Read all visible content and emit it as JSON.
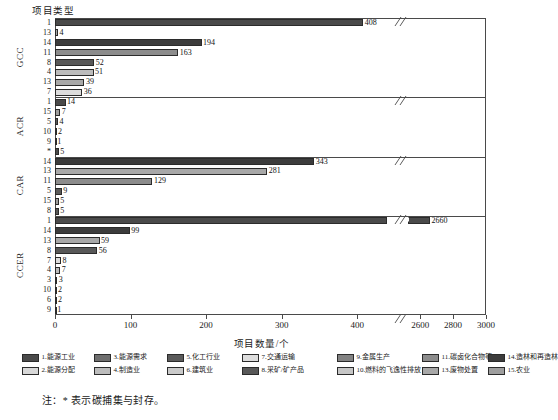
{
  "chart_data": {
    "type": "bar",
    "orientation": "horizontal",
    "title": "",
    "ylabel": "项目类型",
    "xlabel": "项目数量/个",
    "grid": false,
    "legend_position": "bottom",
    "axis_break": {
      "present": true,
      "low_max": 450,
      "high_min": 2550
    },
    "xticks": [
      0,
      100,
      200,
      300,
      400,
      2600,
      2800,
      3000
    ],
    "xlim_low": [
      0,
      450
    ],
    "xlim_high": [
      2550,
      3000
    ],
    "groups": [
      {
        "name": "GCC",
        "bars": [
          {
            "category": "1",
            "value": 408,
            "label": "408",
            "series": 1
          },
          {
            "category": "13",
            "value": 4,
            "label": "4",
            "series": 13
          },
          {
            "category": "14",
            "value": 194,
            "label": "194",
            "series": 14
          },
          {
            "category": "11",
            "value": 163,
            "label": "163",
            "series": 11
          },
          {
            "category": "8",
            "value": 52,
            "label": "52",
            "series": 8
          },
          {
            "category": "4",
            "value": 51,
            "label": "51",
            "series": 4
          },
          {
            "category": "13",
            "value": 39,
            "label": "39",
            "series": 13
          },
          {
            "category": "7",
            "value": 36,
            "label": "36",
            "series": 7
          }
        ]
      },
      {
        "name": "ACR",
        "bars": [
          {
            "category": "1",
            "value": 14,
            "label": "14",
            "series": 1
          },
          {
            "category": "15",
            "value": 7,
            "label": "7",
            "series": 15
          },
          {
            "category": "5",
            "value": 4,
            "label": "4",
            "series": 5
          },
          {
            "category": "10",
            "value": 2,
            "label": "2",
            "series": 10
          },
          {
            "category": "9",
            "value": 1,
            "label": "1",
            "series": 9
          },
          {
            "category": "*",
            "value": 5,
            "label": "5",
            "series": 0
          }
        ]
      },
      {
        "name": "CAR",
        "bars": [
          {
            "category": "14",
            "value": 343,
            "label": "343",
            "series": 14
          },
          {
            "category": "13",
            "value": 281,
            "label": "281",
            "series": 13
          },
          {
            "category": "11",
            "value": 129,
            "label": "129",
            "series": 11
          },
          {
            "category": "5",
            "value": 9,
            "label": "9",
            "series": 5
          },
          {
            "category": "15",
            "value": 5,
            "label": "5",
            "series": 15
          },
          {
            "category": "8",
            "value": 5,
            "label": "5",
            "series": 8
          }
        ]
      },
      {
        "name": "CCER",
        "bars": [
          {
            "category": "1",
            "value": 2660,
            "label": "2660",
            "series": 1
          },
          {
            "category": "14",
            "value": 99,
            "label": "99",
            "series": 14
          },
          {
            "category": "13",
            "value": 59,
            "label": "59",
            "series": 13
          },
          {
            "category": "8",
            "value": 56,
            "label": "56",
            "series": 8
          },
          {
            "category": "7",
            "value": 8,
            "label": "8",
            "series": 7
          },
          {
            "category": "4",
            "value": 7,
            "label": "7",
            "series": 4
          },
          {
            "category": "3",
            "value": 3,
            "label": "3",
            "series": 3
          },
          {
            "category": "10",
            "value": 2,
            "label": "2",
            "series": 10
          },
          {
            "category": "6",
            "value": 2,
            "label": "2",
            "series": 6
          },
          {
            "category": "9",
            "value": 1,
            "label": "1",
            "series": 9
          }
        ]
      }
    ],
    "legend": [
      {
        "id": 1,
        "label": "1.能源工业",
        "color": "#4a4a4a"
      },
      {
        "id": 2,
        "label": "2.能源分配",
        "color": "#d8d8d8"
      },
      {
        "id": 3,
        "label": "3.能源需求",
        "color": "#6e6e6e"
      },
      {
        "id": 4,
        "label": "4.制造业",
        "color": "#bcbcbc"
      },
      {
        "id": 5,
        "label": "5.化工行业",
        "color": "#5a5a5a"
      },
      {
        "id": 6,
        "label": "6.建筑业",
        "color": "#cacaca"
      },
      {
        "id": 7,
        "label": "7.交通运输",
        "color": "#dddddd"
      },
      {
        "id": 8,
        "label": "8.采矿/矿产品",
        "color": "#585858"
      },
      {
        "id": 9,
        "label": "9.金属生产",
        "color": "#828282"
      },
      {
        "id": 10,
        "label": "10.燃料的飞逸性排放",
        "color": "#c6c6c6"
      },
      {
        "id": 11,
        "label": "11.碳卤化合物等",
        "color": "#8c8c8c"
      },
      {
        "id": 13,
        "label": "13.废物处置",
        "color": "#a8a8a8"
      },
      {
        "id": 14,
        "label": "14.造林和再造林",
        "color": "#3c3c3c"
      },
      {
        "id": 15,
        "label": "15.农业",
        "color": "#9e9e9e"
      }
    ]
  },
  "note": "注：* 表示碳捕集与封存。"
}
